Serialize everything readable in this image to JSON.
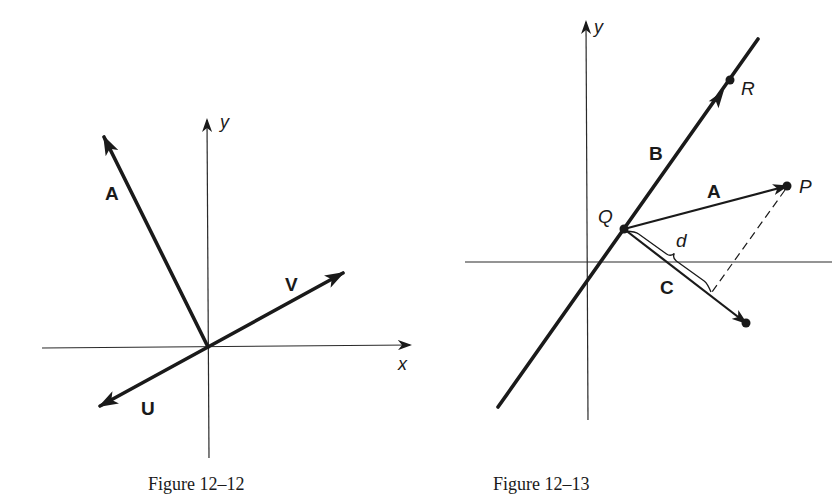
{
  "colors": {
    "ink": "#1a1a1a",
    "background": "#ffffff"
  },
  "figures": [
    {
      "caption": "Figure 12–12",
      "axes": {
        "origin": [
          208,
          347
        ],
        "x_axis": {
          "from": [
            42,
            348
          ],
          "to": [
            410,
            345
          ],
          "label": "x"
        },
        "y_axis": {
          "from": [
            209,
            458
          ],
          "to": [
            207,
            120
          ],
          "label": "y"
        }
      },
      "vectors": [
        {
          "label": "A",
          "from": [
            208,
            347
          ],
          "to": [
            104,
            137
          ]
        },
        {
          "label": "V",
          "from": [
            208,
            347
          ],
          "to": [
            343,
            273
          ]
        },
        {
          "label": "U",
          "from": [
            208,
            347
          ],
          "to": [
            100,
            406
          ]
        }
      ]
    },
    {
      "caption": "Figure 12–13",
      "axes": {
        "x_axis": {
          "from": [
            465,
            262
          ],
          "to": [
            832,
            262
          ]
        },
        "y_axis": {
          "from": [
            588,
            420
          ],
          "to": [
            586,
            22
          ],
          "label": "y"
        }
      },
      "line": {
        "label": "B",
        "from": [
          498,
          407
        ],
        "to": [
          758,
          39
        ],
        "arrow_at": [
          724,
          90
        ]
      },
      "points": [
        {
          "label": "Q",
          "at": [
            624,
            229
          ]
        },
        {
          "label": "R",
          "at": [
            730,
            80
          ]
        },
        {
          "label": "P",
          "at": [
            787,
            186
          ]
        },
        {
          "label": "",
          "at": [
            746,
            323
          ]
        }
      ],
      "vectors": [
        {
          "label": "A",
          "from": [
            624,
            229
          ],
          "to": [
            787,
            186
          ]
        },
        {
          "label": "C",
          "from": [
            624,
            229
          ],
          "to": [
            746,
            323
          ]
        }
      ],
      "dashed": {
        "from": [
          785,
          190
        ],
        "to": [
          712,
          292
        ]
      },
      "brace": {
        "label": "d",
        "from": [
          626,
          231
        ],
        "to": [
          711,
          292
        ]
      }
    }
  ]
}
